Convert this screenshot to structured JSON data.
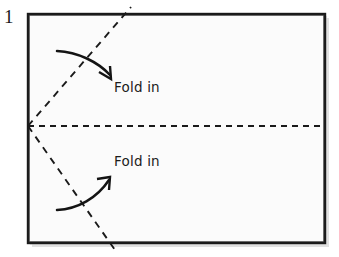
{
  "figure": {
    "step_number": "1",
    "background_color": "#ffffff"
  },
  "paper": {
    "name": "paper-sheet",
    "fill_color": "#fbfbfb",
    "border_color": "#1a1a1a",
    "shadow_color": "#bdbdbd",
    "x": 28,
    "y": 14,
    "width": 297,
    "height": 229
  },
  "fold_lines": [
    {
      "name": "horizontal-center-crease",
      "style": "dashed",
      "color": "#1a1a1a",
      "x1": 28,
      "y1": 126,
      "x2": 325,
      "y2": 126
    },
    {
      "name": "upper-diagonal-crease",
      "style": "dashed",
      "color": "#1a1a1a",
      "x1": 28,
      "y1": 126,
      "x2": 131,
      "y2": 8
    },
    {
      "name": "lower-diagonal-crease",
      "style": "dashed",
      "color": "#1a1a1a",
      "x1": 28,
      "y1": 126,
      "x2": 115,
      "y2": 249
    }
  ],
  "arrows": [
    {
      "name": "fold-in-arrow-top",
      "direction": "down-right",
      "color": "#141414",
      "label_ref": "Fold in"
    },
    {
      "name": "fold-in-arrow-bottom",
      "direction": "up-right",
      "color": "#141414",
      "label_ref": "Fold in"
    }
  ],
  "labels": {
    "fold_in_top": "Fold in",
    "fold_in_bottom": "Fold in"
  },
  "colors": {
    "ink": "#1a1a1a",
    "paper": "#fbfbfb",
    "page": "#ffffff",
    "shadow": "#bdbdbd"
  }
}
